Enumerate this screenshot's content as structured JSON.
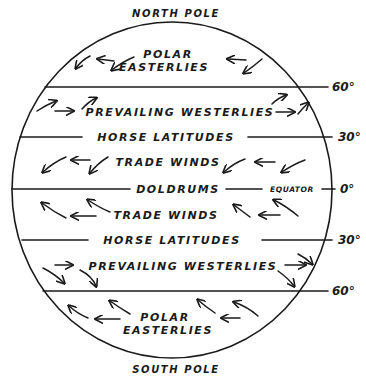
{
  "diagram": {
    "poles": {
      "north": "NORTH POLE",
      "south": "SOUTH POLE"
    },
    "latitudes": [
      {
        "label": "60°",
        "name": "60N"
      },
      {
        "label": "30°",
        "name": "30N"
      },
      {
        "label": "0°",
        "name": "equator"
      },
      {
        "label": "30°",
        "name": "30S"
      },
      {
        "label": "60°",
        "name": "60S"
      }
    ],
    "belts": {
      "north_polar_line1": "POLAR",
      "north_polar_line2": "EASTERLIES",
      "north_westerlies": "PREVAILING WESTERLIES",
      "north_horse": "HORSE LATITUDES",
      "north_trade": "TRADE WINDS",
      "doldrums": "DOLDRUMS",
      "equator": "EQUATOR",
      "south_trade": "TRADE WINDS",
      "south_horse": "HORSE LATITUDES",
      "south_westerlies": "PREVAILING WESTERLIES",
      "south_polar_line1": "POLAR",
      "south_polar_line2": "EASTERLIES"
    },
    "icons": {
      "globe": "globe-outline",
      "arrows": "wind-direction-arrows"
    },
    "colors": {
      "ink": "#1a1a1a",
      "background": "#ffffff"
    }
  }
}
